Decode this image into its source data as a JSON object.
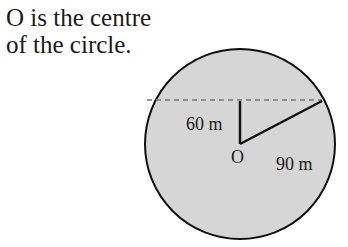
{
  "caption": {
    "line1": "O is the centre",
    "line2": "of the circle."
  },
  "diagram": {
    "center_label": "O",
    "vertical_label": "60 m",
    "radius_label": "90 m",
    "fill_color": "#d6d6d6",
    "stroke_color": "#111111",
    "dash_color": "#777777"
  }
}
